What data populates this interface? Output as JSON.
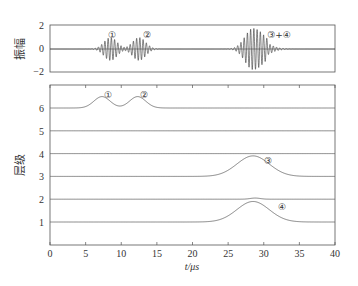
{
  "chart_data": [
    {
      "type": "line",
      "panel": "top",
      "ylabel": "振幅",
      "yticks": [
        "2",
        "0",
        "−2"
      ],
      "ylim": [
        -2,
        2
      ],
      "xlim": [
        0,
        40
      ],
      "grid": false,
      "series": [
        {
          "name": "① wave packet",
          "center_us": 8.5,
          "amplitude": 1.0
        },
        {
          "name": "② wave packet",
          "center_us": 12.5,
          "amplitude": 1.0
        },
        {
          "name": "③+④ wave packet",
          "center_us": 28.5,
          "amplitude": 1.8
        }
      ],
      "annotations": [
        {
          "text": "①",
          "x": 10,
          "y": 1.2
        },
        {
          "text": "②",
          "x": 14.5,
          "y": 1.2
        },
        {
          "text": "③+④",
          "x": 31.5,
          "y": 1.2
        }
      ]
    },
    {
      "type": "line",
      "panel": "bottom",
      "ylabel": "层级",
      "xlabel": "t/μs",
      "xticks": [
        "0",
        "5",
        "10",
        "15",
        "20",
        "25",
        "30",
        "35",
        "40"
      ],
      "yticks": [
        "1",
        "2",
        "3",
        "4",
        "5",
        "6"
      ],
      "xlim": [
        0,
        40
      ],
      "ylim": [
        0,
        7
      ],
      "grid": false,
      "series": [
        {
          "name": "level 6",
          "baseline": 6,
          "bumps": [
            {
              "center": 7.3,
              "height": 0.5
            },
            {
              "center": 12.3,
              "height": 0.5
            }
          ]
        },
        {
          "name": "level 5",
          "baseline": 5,
          "bumps": []
        },
        {
          "name": "level 4",
          "baseline": 4,
          "bumps": []
        },
        {
          "name": "level 3",
          "baseline": 3,
          "bumps": [
            {
              "center": 28.5,
              "height": 0.9
            }
          ]
        },
        {
          "name": "level 2",
          "baseline": 2,
          "bumps": [
            {
              "center": 28.8,
              "height": 0.05
            }
          ]
        },
        {
          "name": "level 1",
          "baseline": 1,
          "bumps": [
            {
              "center": 28.5,
              "height": 0.9
            }
          ]
        }
      ],
      "annotations": [
        {
          "text": "①",
          "x": 8.2,
          "y": 6.8
        },
        {
          "text": "②",
          "x": 13.2,
          "y": 6.8
        },
        {
          "text": "③",
          "x": 31,
          "y": 3.9
        },
        {
          "text": "④",
          "x": 33,
          "y": 1.9
        }
      ]
    }
  ],
  "labels": {
    "top_ylabel": "振幅",
    "bottom_ylabel": "层级",
    "xlabel": "t/μs",
    "top_yticks": [
      "2",
      "0",
      "−2"
    ],
    "bottom_yticks": [
      "6",
      "5",
      "4",
      "3",
      "2",
      "1"
    ],
    "xticks": [
      "0",
      "5",
      "10",
      "15",
      "20",
      "25",
      "30",
      "35",
      "40"
    ],
    "annot_1": "①",
    "annot_2": "②",
    "annot_34": "③+④",
    "annot_3": "③",
    "annot_4": "④"
  }
}
